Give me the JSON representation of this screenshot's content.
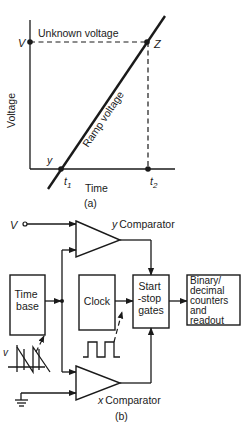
{
  "figure_a": {
    "caption": "(a)",
    "axis_y_label": "Voltage",
    "axis_x_label": "Time",
    "unknown_voltage_label": "Unknown voltage",
    "ramp_label": "Ramp voltage",
    "point_v": "V",
    "point_z": "Z",
    "point_y": "y",
    "tick_t1": "t",
    "tick_t1_sub": "1",
    "tick_t2": "t",
    "tick_t2_sub": "2"
  },
  "figure_b": {
    "caption": "(b)",
    "input_v": "V",
    "y_comparator": {
      "prefix": "y",
      "label": "Comparator"
    },
    "x_comparator": {
      "prefix": "x",
      "label": "Comparator"
    },
    "blocks": {
      "time_base": [
        "Time",
        "base"
      ],
      "clock": [
        "Clock"
      ],
      "start_stop": [
        "Start",
        "-stop",
        "gates"
      ],
      "counters": [
        "Binary/",
        "decimal",
        "counters",
        "and",
        "readout"
      ]
    },
    "sawtooth_label": "v"
  },
  "colors": {
    "ink": "#1a1a1a",
    "paper": "#ffffff"
  }
}
